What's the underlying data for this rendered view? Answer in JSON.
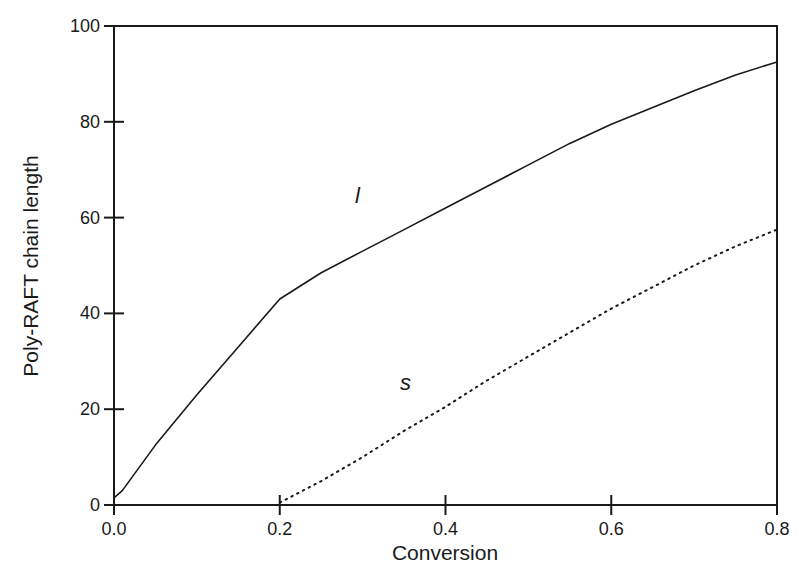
{
  "chart_data": {
    "type": "line",
    "title": "",
    "xlabel": "Conversion",
    "ylabel": "Poly-RAFT chain length",
    "xlim": [
      0.0,
      0.8
    ],
    "ylim": [
      0,
      100
    ],
    "xticks": [
      "0.0",
      "0.2",
      "0.4",
      "0.6",
      "0.8"
    ],
    "yticks": [
      "0",
      "20",
      "40",
      "60",
      "80",
      "100"
    ],
    "grid": false,
    "legend": null,
    "series": [
      {
        "name": "l",
        "style": "solid",
        "x": [
          0.0,
          0.01,
          0.05,
          0.1,
          0.15,
          0.2,
          0.25,
          0.3,
          0.35,
          0.4,
          0.45,
          0.5,
          0.55,
          0.6,
          0.65,
          0.7,
          0.75,
          0.8
        ],
        "y": [
          1.5,
          3,
          12.5,
          23,
          33,
          43,
          48.5,
          53,
          57.5,
          62,
          66.5,
          71,
          75.5,
          79.5,
          83,
          86.5,
          89.8,
          92.5
        ]
      },
      {
        "name": "s",
        "style": "dotted",
        "x": [
          0.2,
          0.25,
          0.3,
          0.35,
          0.4,
          0.45,
          0.5,
          0.55,
          0.6,
          0.65,
          0.7,
          0.75,
          0.8
        ],
        "y": [
          0.5,
          5,
          10,
          15.5,
          20.5,
          26,
          31,
          36,
          41,
          45.5,
          50,
          54,
          57.5
        ]
      }
    ],
    "annotations": [
      {
        "text": "l",
        "x": 0.295,
        "y": 64
      },
      {
        "text": "s",
        "x": 0.35,
        "y": 24
      }
    ]
  },
  "axes": {
    "x_title": "Conversion",
    "y_title": "Poly-RAFT chain length"
  },
  "labels": {
    "curve_l": "l",
    "curve_s": "s"
  }
}
